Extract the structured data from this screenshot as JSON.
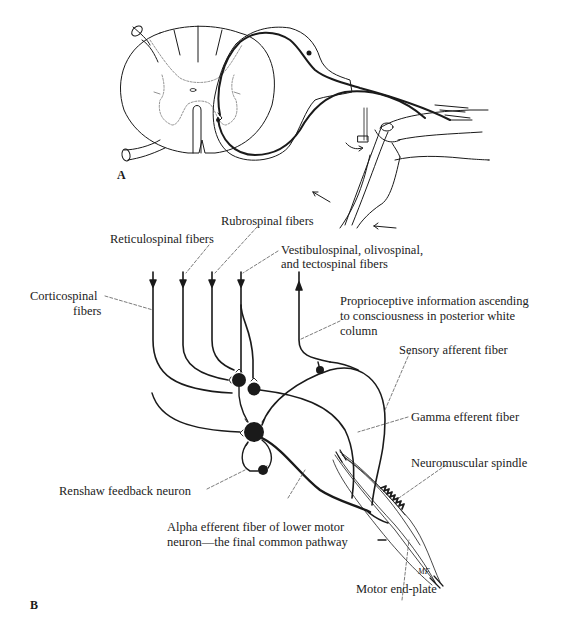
{
  "figure": {
    "panel_a": {
      "label": "A",
      "title": "Spinal cord cross-section with reflex arc to knee (muscle stretch reflex)"
    },
    "panel_b": {
      "label": "B",
      "labels": {
        "rubrospinal": "Rubrospinal fibers",
        "reticulospinal": "Reticulospinal fibers",
        "vestibulospinal_l1": "Vestibulospinal, olivospinal,",
        "vestibulospinal_l2": "and tectospinal fibers",
        "corticospinal_l1": "Corticospinal",
        "corticospinal_l2": "fibers",
        "proprioceptive_l1": "Proprioceptive information ascending",
        "proprioceptive_l2": "to consciousness in posterior white",
        "proprioceptive_l3": "column",
        "sensory_afferent": "Sensory afferent fiber",
        "gamma_efferent": "Gamma efferent fiber",
        "neuromuscular_spindle": "Neuromuscular spindle",
        "renshaw": "Renshaw feedback neuron",
        "alpha_l1": "Alpha efferent fiber of lower motor",
        "alpha_l2": "neuron—the final common pathway",
        "motor_end_plate": "Motor end-plate",
        "artist_initials": "MF"
      }
    },
    "colors": {
      "ink": "#1a1a1a",
      "faint": "#555555",
      "background": "#ffffff"
    }
  }
}
